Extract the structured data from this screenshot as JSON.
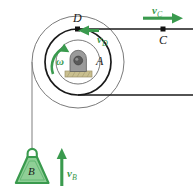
{
  "figure": {
    "colors": {
      "vector_green": "#3a9a4e",
      "body_green_fill": "#8fcf96",
      "body_green_stroke": "#3a9a4e",
      "line_black": "#1a1a1a",
      "circle_gray": "#6b6b6b",
      "hub_gray": "#8a8a8a",
      "base_tan": "#c9bf8f"
    },
    "labels": {
      "pulley": "A",
      "point_d": "D",
      "point_c": "C",
      "weight": "B",
      "omega": "ω",
      "velocity_c_symbol": "v",
      "velocity_c_sub": "C",
      "velocity_d_symbol": "v",
      "velocity_d_sub": "D",
      "velocity_b_symbol": "v",
      "velocity_b_sub": "B"
    },
    "geometry": {
      "center_x": 78,
      "center_y": 62,
      "outer_radius": 46,
      "middle_radius": 33,
      "inner_radius": 22,
      "point_d_x": 78,
      "point_d_y": 29,
      "point_c_x": 163,
      "point_c_y": 29,
      "cord_left_x": 32,
      "cord_bottom_y": 95,
      "weight_center_x": 32,
      "weight_top_y": 148
    },
    "arrows": {
      "v_c": {
        "direction": "right",
        "x1": 143,
        "y1": 18,
        "x2": 181,
        "y2": 18
      },
      "v_d": {
        "direction": "left",
        "x1": 98,
        "y1": 31,
        "x2": 80,
        "y2": 31
      },
      "v_b": {
        "direction": "up",
        "x1": 62,
        "y1": 186,
        "x2": 62,
        "y2": 150
      },
      "omega": {
        "direction": "counterclockwise-up",
        "description": "curved arrow about center pointing up"
      }
    }
  }
}
